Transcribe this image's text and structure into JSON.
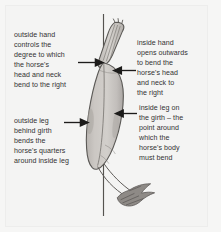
{
  "diagram": {
    "background_color": "#f4f4f3",
    "line_color": "#4a4a4a",
    "body_fill": "#c7c3bf",
    "body_outline": "#5c5a57",
    "text_color": "#333132"
  },
  "reference_line": {
    "name": "vertical-reference-line",
    "orientation": "vertical"
  },
  "labels": {
    "outside_hand": "outside hand\ncontrols the\ndegree to which\nthe horse's\nhead and neck\nbend to the right",
    "inside_hand": "inside hand\nopens outwards\nto bend the\nhorse's head\nand neck to\nthe right",
    "outside_leg": "outside leg\nbehind girth\nbends the\nhorse's quarters\naround inside leg",
    "inside_leg": "inside leg on\nthe girth – the\npoint around\nwhich the\nhorse's body\nmust bend"
  },
  "arrows": [
    {
      "name": "arrow-outside-hand",
      "direction": "right",
      "points_to": "neck"
    },
    {
      "name": "arrow-inside-hand",
      "direction": "left",
      "points_to": "neck"
    },
    {
      "name": "arrow-outside-leg",
      "direction": "right",
      "points_to": "quarters"
    },
    {
      "name": "arrow-inside-leg",
      "direction": "left",
      "points_to": "girth"
    }
  ],
  "horse_parts": [
    {
      "name": "head-and-neck"
    },
    {
      "name": "body-barrel"
    },
    {
      "name": "quarters"
    },
    {
      "name": "tail"
    }
  ]
}
